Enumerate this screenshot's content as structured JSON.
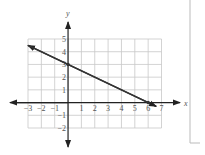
{
  "chart_data": {
    "type": "line",
    "title": "",
    "xlabel": "x",
    "ylabel": "y",
    "xlim": [
      -3,
      7
    ],
    "ylim": [
      -2,
      5
    ],
    "grid": true,
    "x_ticks": [
      "-3",
      "-2",
      "-1",
      "1",
      "2",
      "3",
      "4",
      "5",
      "6",
      "7"
    ],
    "y_ticks": [
      "-2",
      "-1",
      "1",
      "2",
      "3",
      "4",
      "5"
    ],
    "series": [
      {
        "name": "line",
        "points": [
          [
            -3,
            4.5
          ],
          [
            0,
            3
          ],
          [
            6,
            0
          ],
          [
            6.6,
            -0.3
          ]
        ],
        "arrows_both_ends": true
      }
    ],
    "marked_points": [
      [
        0,
        3
      ],
      [
        6,
        0
      ]
    ],
    "colors": {
      "grid": "#c8c8c8",
      "axis": "#222222",
      "line": "#333333"
    }
  }
}
